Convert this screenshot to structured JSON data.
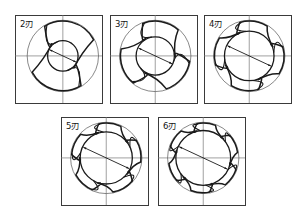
{
  "figure": {
    "title": "",
    "background_color": "#ffffff",
    "stroke_color": "#1a1a1a",
    "thin_stroke_color": "#555555",
    "panel_border_color": "#3a3a3a",
    "centerline_color": "#777777",
    "panels": [
      {
        "id": "panel-2-flute",
        "label": "2刃",
        "flute_count": 2,
        "row": 1,
        "column": 1,
        "x": 15,
        "y": 15,
        "w": 87,
        "h": 88,
        "center_x": 0.55,
        "center_y": 0.465,
        "outer_radius": 0.41,
        "core_radius": 0.175,
        "dimension_arrow": true,
        "dimension_arrow_angle_deg": 205
      },
      {
        "id": "panel-3-flute",
        "label": "3刃",
        "flute_count": 3,
        "row": 1,
        "column": 2,
        "x": 110,
        "y": 15,
        "w": 87,
        "h": 88,
        "center_x": 0.52,
        "center_y": 0.465,
        "outer_radius": 0.41,
        "core_radius": 0.22,
        "dimension_arrow": true,
        "dimension_arrow_angle_deg": 205
      },
      {
        "id": "panel-4-flute",
        "label": "4刃",
        "flute_count": 4,
        "row": 1,
        "column": 3,
        "x": 204,
        "y": 15,
        "w": 87,
        "h": 88,
        "center_x": 0.52,
        "center_y": 0.465,
        "outer_radius": 0.41,
        "core_radius": 0.285,
        "dimension_arrow": true,
        "dimension_arrow_angle_deg": 205
      },
      {
        "id": "panel-5-flute",
        "label": "5刃",
        "flute_count": 5,
        "row": 2,
        "column": 1,
        "x": 61,
        "y": 117,
        "w": 87,
        "h": 88,
        "center_x": 0.52,
        "center_y": 0.465,
        "outer_radius": 0.41,
        "core_radius": 0.3,
        "dimension_arrow": true,
        "dimension_arrow_angle_deg": 205
      },
      {
        "id": "panel-6-flute",
        "label": "6刃",
        "flute_count": 6,
        "row": 2,
        "column": 2,
        "x": 158,
        "y": 117,
        "w": 87,
        "h": 88,
        "center_x": 0.52,
        "center_y": 0.465,
        "outer_radius": 0.41,
        "core_radius": 0.315,
        "dimension_arrow": true,
        "dimension_arrow_angle_deg": 205
      }
    ]
  }
}
